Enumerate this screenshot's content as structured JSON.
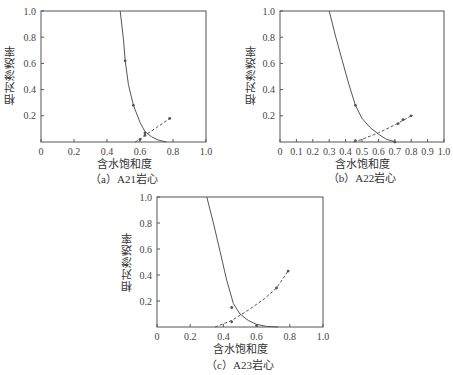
{
  "chart_data": [
    {
      "id": "a",
      "type": "line",
      "caption": "（a）A21岩心",
      "xlabel": "含水饱和度",
      "ylabel": "相对渗透率",
      "xlim": [
        0,
        1.0
      ],
      "ylim": [
        0,
        1.0
      ],
      "xticks": [
        "0",
        "0.2",
        "0.4",
        "0.6",
        "0.8",
        "1.0"
      ],
      "yticks": [
        "0.2",
        "0.4",
        "0.6",
        "0.8",
        "1.0"
      ],
      "grid": false,
      "series": [
        {
          "name": "油相相对渗透率",
          "style": "solid",
          "x": [
            0.48,
            0.5,
            0.51,
            0.53,
            0.56,
            0.6,
            0.63,
            0.67,
            0.71,
            0.76
          ],
          "y": [
            1.0,
            0.78,
            0.62,
            0.44,
            0.28,
            0.15,
            0.08,
            0.04,
            0.015,
            0.0
          ],
          "markers": [
            [
              0.51,
              0.62
            ],
            [
              0.56,
              0.28
            ],
            [
              0.63,
              0.07
            ]
          ]
        },
        {
          "name": "水相相对渗透率",
          "style": "dashed",
          "x": [
            0.57,
            0.6,
            0.63,
            0.7,
            0.78
          ],
          "y": [
            0.0,
            0.02,
            0.05,
            0.11,
            0.18
          ],
          "markers": [
            [
              0.6,
              0.02
            ],
            [
              0.63,
              0.05
            ],
            [
              0.78,
              0.18
            ]
          ]
        }
      ]
    },
    {
      "id": "b",
      "type": "line",
      "caption": "（b）A22岩心",
      "xlabel": "含水饱和度",
      "ylabel": "相对渗透率",
      "xlim": [
        0,
        1.0
      ],
      "ylim": [
        0,
        1.0
      ],
      "xticks": [
        "0",
        "0.1",
        "0.2",
        "0.3",
        "0.4",
        "0.5",
        "0.6",
        "0.7",
        "0.8",
        "0.9",
        "1.0"
      ],
      "yticks": [
        "0.2",
        "0.4",
        "0.6",
        "0.8",
        "1.0"
      ],
      "grid": false,
      "series": [
        {
          "name": "油相相对渗透率",
          "style": "solid",
          "x": [
            0.3,
            0.34,
            0.38,
            0.42,
            0.46,
            0.5,
            0.55,
            0.6,
            0.65,
            0.71
          ],
          "y": [
            1.0,
            0.8,
            0.62,
            0.44,
            0.28,
            0.18,
            0.11,
            0.06,
            0.02,
            0.0
          ],
          "markers": [
            [
              0.46,
              0.28
            ],
            [
              0.7,
              0.0
            ]
          ]
        },
        {
          "name": "水相相对渗透率",
          "style": "dashed",
          "x": [
            0.45,
            0.5,
            0.6,
            0.7,
            0.8
          ],
          "y": [
            0.0,
            0.02,
            0.07,
            0.13,
            0.2
          ],
          "markers": [
            [
              0.46,
              0.01
            ],
            [
              0.72,
              0.14
            ],
            [
              0.75,
              0.17
            ],
            [
              0.8,
              0.2
            ]
          ]
        }
      ]
    },
    {
      "id": "c",
      "type": "line",
      "caption": "（c）A23岩心",
      "xlabel": "含水饱和度",
      "ylabel": "相对渗透率",
      "xlim": [
        0,
        1.0
      ],
      "ylim": [
        0,
        1.0
      ],
      "xticks": [
        "0",
        "0.2",
        "0.4",
        "0.6",
        "0.8",
        "1.0"
      ],
      "yticks": [
        "0.2",
        "0.4",
        "0.6",
        "0.8",
        "1.0"
      ],
      "grid": false,
      "series": [
        {
          "name": "油相相对渗透率",
          "style": "solid",
          "x": [
            0.3,
            0.34,
            0.38,
            0.42,
            0.46,
            0.5,
            0.55,
            0.6,
            0.66,
            0.73
          ],
          "y": [
            1.0,
            0.8,
            0.58,
            0.36,
            0.18,
            0.1,
            0.05,
            0.02,
            0.005,
            0.0
          ],
          "markers": [
            [
              0.45,
              0.15
            ],
            [
              0.6,
              0.01
            ]
          ]
        },
        {
          "name": "水相相对渗透率",
          "style": "dashed",
          "x": [
            0.35,
            0.45,
            0.55,
            0.65,
            0.72,
            0.79
          ],
          "y": [
            0.0,
            0.05,
            0.13,
            0.22,
            0.3,
            0.43
          ],
          "markers": [
            [
              0.45,
              0.04
            ],
            [
              0.72,
              0.3
            ],
            [
              0.79,
              0.43
            ]
          ]
        }
      ]
    }
  ],
  "panels": {
    "a": {
      "caption": "（a）A21岩心",
      "xlabel": "含水饱和度",
      "ylabel": "相对渗透率"
    },
    "b": {
      "caption": "（b）A22岩心",
      "xlabel": "含水饱和度",
      "ylabel": "相对渗透率"
    },
    "c": {
      "caption": "（c）A23岩心",
      "xlabel": "含水饱和度",
      "ylabel": "相对渗透率"
    }
  },
  "colors": {
    "axis": "#555555",
    "line": "#555555",
    "text": "#333333"
  }
}
